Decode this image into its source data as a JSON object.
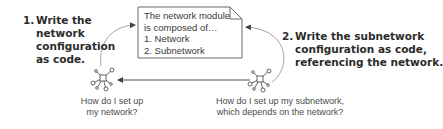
{
  "diagram": {
    "document": {
      "lines": [
        "The network module",
        "is composed of…",
        "1. Network",
        "2. Subnetwork"
      ]
    },
    "steps": [
      {
        "number": "1.",
        "lines": [
          "Write the",
          "network",
          "configuration",
          "as code."
        ]
      },
      {
        "number": "2.",
        "lines": [
          "Write the subnetwork",
          "configuration as code,",
          "referencing the network."
        ]
      }
    ],
    "nodes": [
      {
        "icon": "network-hub-icon",
        "question_lines": [
          "How do I set up",
          "my network?"
        ]
      },
      {
        "icon": "network-hub-icon",
        "question_lines": [
          "How do I set up my subnetwork,",
          "which depends on the network?"
        ]
      }
    ],
    "arrows": [
      {
        "from": "network-node",
        "to": "document",
        "shape": "curve"
      },
      {
        "from": "subnetwork-node",
        "to": "document",
        "shape": "curve"
      },
      {
        "from": "subnetwork-node",
        "to": "network-node",
        "shape": "straight",
        "meaning": "depends on"
      }
    ],
    "colors": {
      "line": "#555555",
      "text_bold": "#2b2b2b",
      "text_regular": "#4a4a4a",
      "box_border": "#6a6a6a"
    }
  }
}
